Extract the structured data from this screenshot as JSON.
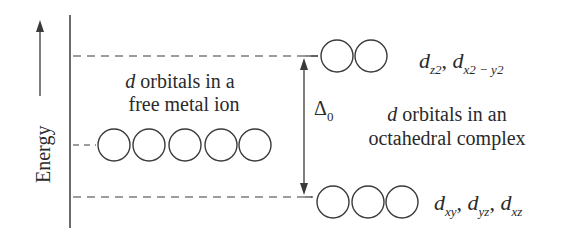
{
  "diagram": {
    "axis_label": "Energy",
    "free_ion": {
      "label_line1_italic": "d",
      "label_line1_rest": " orbitals in a",
      "label_line2": "free metal ion",
      "orbital_count": 5
    },
    "complex": {
      "label_line1_italic": "d",
      "label_line1_rest": " orbitals in an",
      "label_line2": "octahedral complex"
    },
    "splitting": {
      "symbol": "Δ",
      "subscript": "0"
    },
    "eg_set": {
      "orbital_count": 2,
      "labels": [
        {
          "base": "d",
          "sub": "z2"
        },
        {
          "base": "d",
          "sub": "x2 − y2"
        }
      ]
    },
    "t2g_set": {
      "orbital_count": 3,
      "labels": [
        {
          "base": "d",
          "sub": "xy"
        },
        {
          "base": "d",
          "sub": "yz"
        },
        {
          "base": "d",
          "sub": "xz"
        }
      ]
    },
    "separator": ", ",
    "colors": {
      "line": "#3a3a3a",
      "text": "#2a2a2a",
      "background": "#ffffff"
    }
  }
}
